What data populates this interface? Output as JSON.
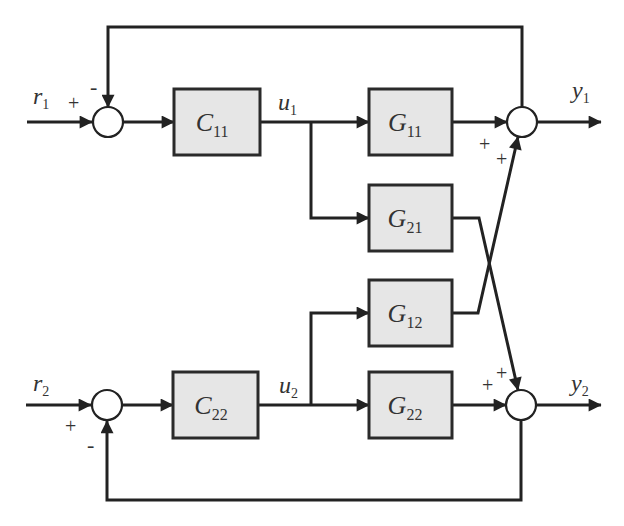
{
  "diagram": {
    "type": "MIMO feedback control block diagram",
    "colors": {
      "line": "#222222",
      "block_fill": "#e6e6e6",
      "block_stroke": "#2a2a2a",
      "junction_fill": "#ffffff"
    },
    "inputs": [
      {
        "id": "r1",
        "base": "r",
        "sub": "1"
      },
      {
        "id": "r2",
        "base": "r",
        "sub": "2"
      }
    ],
    "outputs": [
      {
        "id": "y1",
        "base": "y",
        "sub": "1"
      },
      {
        "id": "y2",
        "base": "y",
        "sub": "2"
      }
    ],
    "signals": [
      {
        "id": "u1",
        "base": "u",
        "sub": "1"
      },
      {
        "id": "u2",
        "base": "u",
        "sub": "2"
      }
    ],
    "blocks": [
      {
        "id": "C11",
        "base": "C",
        "sub": "11"
      },
      {
        "id": "C22",
        "base": "C",
        "sub": "22"
      },
      {
        "id": "G11",
        "base": "G",
        "sub": "11"
      },
      {
        "id": "G21",
        "base": "G",
        "sub": "21"
      },
      {
        "id": "G12",
        "base": "G",
        "sub": "12"
      },
      {
        "id": "G22",
        "base": "G",
        "sub": "22"
      }
    ],
    "signs": {
      "sum1_in": "+",
      "sum1_fb": "-",
      "sum2_g11": "+",
      "sum2_g12": "+",
      "sum3_in": "+",
      "sum3_fb": "-",
      "sum4_g21": "+",
      "sum4_g22": "+"
    }
  }
}
